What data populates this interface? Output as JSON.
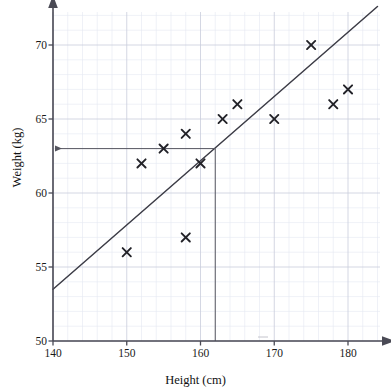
{
  "chart_data": {
    "type": "scatter",
    "title": "",
    "xlabel": "Height (cm)",
    "ylabel": "Weight (kg)",
    "xlim": [
      140,
      185
    ],
    "ylim": [
      50,
      72
    ],
    "xticks": [
      140,
      150,
      160,
      170,
      180
    ],
    "yticks": [
      50,
      55,
      60,
      65,
      70
    ],
    "grid": true,
    "grid_major_step_x": 10,
    "grid_minor_step_x": 2,
    "grid_major_step_y": 5,
    "grid_minor_step_y": 1,
    "legend": null,
    "points": [
      {
        "x": 150,
        "y": 56
      },
      {
        "x": 152,
        "y": 62
      },
      {
        "x": 155,
        "y": 63
      },
      {
        "x": 158,
        "y": 57
      },
      {
        "x": 158,
        "y": 64
      },
      {
        "x": 160,
        "y": 62
      },
      {
        "x": 163,
        "y": 65
      },
      {
        "x": 165,
        "y": 66
      },
      {
        "x": 170,
        "y": 65
      },
      {
        "x": 175,
        "y": 70
      },
      {
        "x": 178,
        "y": 66
      },
      {
        "x": 180,
        "y": 67
      }
    ],
    "marker": "x",
    "trend_line": {
      "label": "line of best fit",
      "x_start": 140,
      "y_start": 53.5,
      "x_end": 184,
      "y_end": 72.6
    },
    "annotations": [
      {
        "name": "read-off-vertical",
        "type": "vertical-line",
        "x": 162,
        "y_from": 50,
        "y_to": 63
      },
      {
        "name": "read-off-horizontal",
        "type": "horizontal-arrow",
        "y": 63,
        "x_from": 162,
        "x_to": 140,
        "arrow_at": "left"
      }
    ]
  },
  "axes": {
    "x_title": "Height (cm)",
    "y_title": "Weight (kg)",
    "x_tick_labels": [
      "140",
      "150",
      "160",
      "170",
      "180"
    ],
    "y_tick_labels": [
      "50",
      "55",
      "60",
      "65",
      "70"
    ]
  },
  "colors": {
    "axis": "#4a4a55",
    "marker": "#222228",
    "trend": "#3c3c46",
    "grid_major": "#c9cddc",
    "grid_minor": "#e4e7f2",
    "annotation": "#55555f",
    "background": "#ffffff"
  }
}
